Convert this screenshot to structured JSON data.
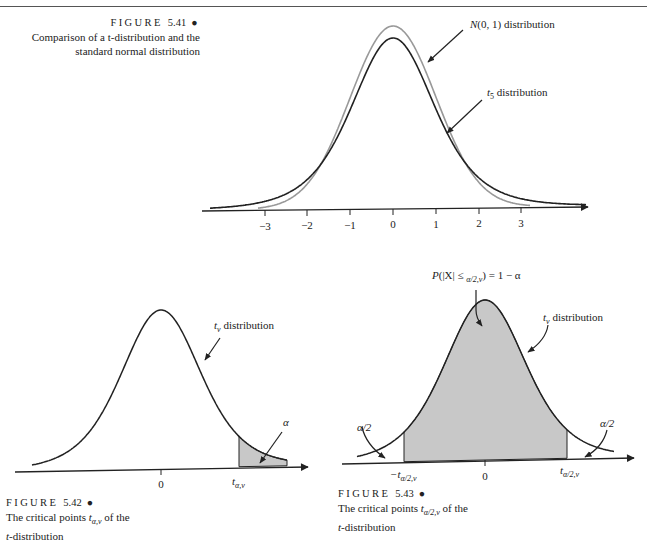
{
  "page": {
    "page_number": "250"
  },
  "figures": [
    {
      "id": "fig-5-41",
      "caption_head": "FIGURE",
      "caption_number": "5.41",
      "caption_bullet": "●",
      "caption_lines": [
        "Comparison of a t-distribution and the",
        "standard normal distribution"
      ],
      "annotations": {
        "normal_label": "N(0, 1) distribution",
        "t5_label_prefix": "t",
        "t5_label_sub": "5",
        "t5_label_suffix": " distribution"
      },
      "axis_ticks": [
        "−3",
        "−2",
        "−1",
        "0",
        "1",
        "2",
        "3"
      ]
    },
    {
      "id": "fig-5-42",
      "caption_head": "FIGURE",
      "caption_number": "5.42",
      "caption_bullet": "●",
      "caption_lines": [
        "The critical points t",
        "α,ν",
        " of the",
        "t-distribution"
      ],
      "annotations": {
        "curve_label_prefix": "t",
        "curve_label_sub": "ν",
        "curve_label_suffix": " distribution",
        "tail_label": "α",
        "critical_point_prefix": "t",
        "critical_point_sub": "α,ν"
      },
      "axis_ticks": [
        "0"
      ]
    },
    {
      "id": "fig-5-43",
      "caption_head": "FIGURE",
      "caption_number": "5.43",
      "caption_bullet": "●",
      "caption_lines": [
        "The critical points t",
        "α/2,ν",
        " of the",
        "t-distribution"
      ],
      "annotations": {
        "probability_label": "P(|X| ≤ t",
        "probability_label_sub": "α/2,ν",
        "probability_label_suffix": ") = 1 − α",
        "curve_label_prefix": "t",
        "curve_label_sub": "ν",
        "curve_label_suffix": " distribution",
        "left_tail_label": "α/2",
        "right_tail_label": "α/2",
        "left_critical_prefix": "−t",
        "left_critical_sub": "α/2,ν",
        "right_critical_prefix": "t",
        "right_critical_sub": "α/2,ν"
      },
      "axis_ticks": [
        "0"
      ]
    }
  ],
  "colors": {
    "curve_dark": "#222222",
    "curve_normal": "#999999",
    "shade": "#c8c8c8"
  }
}
